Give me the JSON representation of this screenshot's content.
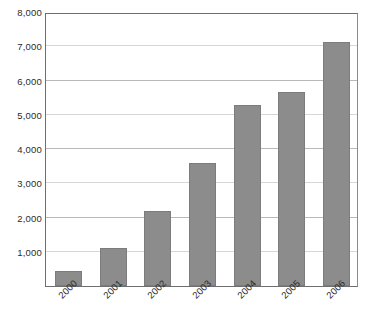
{
  "chart_data": {
    "type": "bar",
    "title": "",
    "subtitle": "",
    "xlabel": "",
    "ylabel": "",
    "categories": [
      "2000",
      "2001",
      "2002",
      "2003",
      "2004",
      "2005",
      "2006"
    ],
    "values": [
      440,
      1100,
      2200,
      3580,
      5280,
      5660,
      7120
    ],
    "series": [
      {
        "name": "",
        "values": [
          440,
          1100,
          2200,
          3580,
          5280,
          5660,
          7120
        ]
      }
    ],
    "ylim": [
      0,
      8000
    ],
    "ytick_values": [
      1000,
      2000,
      3000,
      4000,
      5000,
      6000,
      7000,
      8000
    ],
    "ytick_labels": [
      "1,000",
      "2,000",
      "3,000",
      "4,000",
      "5,000",
      "6,000",
      "7,000",
      "8,000"
    ],
    "grid": true,
    "grid_axis": "y",
    "legend": false,
    "legend_position": "none",
    "annotations": [],
    "colors": {
      "bar_fill": "#8c8c8c",
      "bar_stroke": "#7c7c7c",
      "gridline": "#b9b9b9",
      "gridline_soft": "#d6d6d6",
      "axis": "#6f6f6f",
      "text": "#2b2b2b",
      "background": "#ffffff"
    },
    "xtick_rotation": -45
  }
}
